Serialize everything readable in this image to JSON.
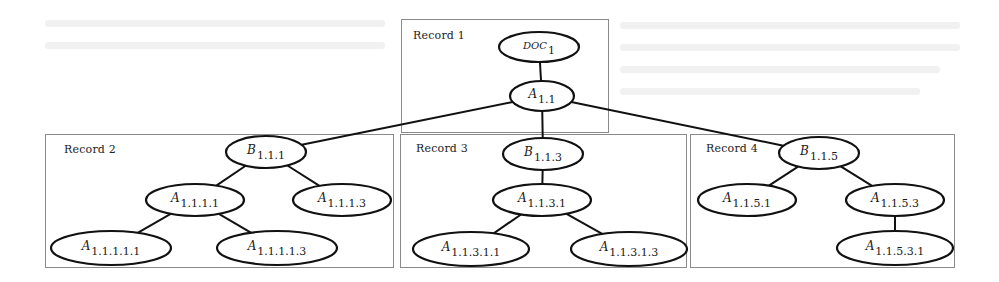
{
  "diagram": {
    "type": "tree",
    "records": [
      {
        "id": "record-1",
        "label": "Record 1",
        "box": {
          "x": 401,
          "y": 19,
          "w": 208,
          "h": 114
        },
        "label_pos": {
          "x": 413,
          "y": 38
        }
      },
      {
        "id": "record-2",
        "label": "Record 2",
        "box": {
          "x": 45,
          "y": 134,
          "w": 349,
          "h": 134
        },
        "label_pos": {
          "x": 64,
          "y": 152
        }
      },
      {
        "id": "record-3",
        "label": "Record 3",
        "box": {
          "x": 400,
          "y": 134,
          "w": 287,
          "h": 134
        },
        "label_pos": {
          "x": 416,
          "y": 151
        }
      },
      {
        "id": "record-4",
        "label": "Record 4",
        "box": {
          "x": 690,
          "y": 134,
          "w": 265,
          "h": 134
        },
        "label_pos": {
          "x": 706,
          "y": 151
        }
      }
    ],
    "nodes": [
      {
        "id": "doc1",
        "base": "DOC",
        "sub": "1",
        "cx": 539,
        "cy": 47,
        "rx": 40,
        "ry": 15,
        "record": "record-1",
        "small_caps": true
      },
      {
        "id": "a11",
        "base": "A",
        "sub": "1.1",
        "cx": 542,
        "cy": 96,
        "rx": 32,
        "ry": 15,
        "record": "record-1"
      },
      {
        "id": "b111",
        "base": "B",
        "sub": "1.1.1",
        "cx": 266,
        "cy": 152,
        "rx": 40,
        "ry": 16,
        "record": "record-2"
      },
      {
        "id": "a1111",
        "base": "A",
        "sub": "1.1.1.1",
        "cx": 195,
        "cy": 200,
        "rx": 49,
        "ry": 16,
        "record": "record-2"
      },
      {
        "id": "a1113",
        "base": "A",
        "sub": "1.1.1.3",
        "cx": 342,
        "cy": 200,
        "rx": 49,
        "ry": 16,
        "record": "record-2"
      },
      {
        "id": "a11111",
        "base": "A",
        "sub": "1.1.1.1.1",
        "cx": 111,
        "cy": 248,
        "rx": 60,
        "ry": 17,
        "record": "record-2"
      },
      {
        "id": "a11113",
        "base": "A",
        "sub": "1.1.1.1.3",
        "cx": 277,
        "cy": 248,
        "rx": 60,
        "ry": 17,
        "record": "record-2"
      },
      {
        "id": "b113",
        "base": "B",
        "sub": "1.1.3",
        "cx": 543,
        "cy": 154,
        "rx": 40,
        "ry": 16,
        "record": "record-3"
      },
      {
        "id": "a1131",
        "base": "A",
        "sub": "1.1.3.1",
        "cx": 542,
        "cy": 200,
        "rx": 49,
        "ry": 16,
        "record": "record-3"
      },
      {
        "id": "a11311",
        "base": "A",
        "sub": "1.1.3.1.1",
        "cx": 471,
        "cy": 249,
        "rx": 58,
        "ry": 17,
        "record": "record-3"
      },
      {
        "id": "a11313",
        "base": "A",
        "sub": "1.1.3.1.3",
        "cx": 629,
        "cy": 249,
        "rx": 58,
        "ry": 17,
        "record": "record-3"
      },
      {
        "id": "b115",
        "base": "B",
        "sub": "1.1.5",
        "cx": 819,
        "cy": 153,
        "rx": 40,
        "ry": 16,
        "record": "record-4"
      },
      {
        "id": "a1151",
        "base": "A",
        "sub": "1.1.5.1",
        "cx": 747,
        "cy": 200,
        "rx": 49,
        "ry": 16,
        "record": "record-4"
      },
      {
        "id": "a1153",
        "base": "A",
        "sub": "1.1.5.3",
        "cx": 895,
        "cy": 200,
        "rx": 49,
        "ry": 16,
        "record": "record-4"
      },
      {
        "id": "a11531",
        "base": "A",
        "sub": "1.1.5.3.1",
        "cx": 895,
        "cy": 248,
        "rx": 58,
        "ry": 17,
        "record": "record-4"
      }
    ],
    "edges": [
      {
        "from": "doc1",
        "to": "a11"
      },
      {
        "from": "a11",
        "to": "b111"
      },
      {
        "from": "a11",
        "to": "b113"
      },
      {
        "from": "a11",
        "to": "b115"
      },
      {
        "from": "b111",
        "to": "a1111"
      },
      {
        "from": "b111",
        "to": "a1113"
      },
      {
        "from": "a1111",
        "to": "a11111"
      },
      {
        "from": "a1111",
        "to": "a11113"
      },
      {
        "from": "b113",
        "to": "a1131"
      },
      {
        "from": "a1131",
        "to": "a11311"
      },
      {
        "from": "a1131",
        "to": "a11313"
      },
      {
        "from": "b115",
        "to": "a1151"
      },
      {
        "from": "b115",
        "to": "a1153"
      },
      {
        "from": "a1153",
        "to": "a11531"
      }
    ],
    "colors": {
      "stroke": "#111111",
      "box_border": "#8a8a8a",
      "background": "#ffffff",
      "text": "#1a1a1a"
    }
  }
}
